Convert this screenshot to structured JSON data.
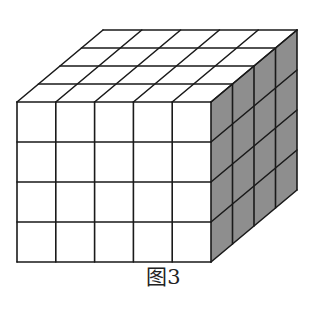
{
  "figure": {
    "caption": "图3",
    "grid": {
      "width_units": 5,
      "height_units": 4,
      "depth_units": 4
    },
    "colors": {
      "line": "#1a1a1a",
      "front_face": "#ffffff",
      "top_face": "#ffffff",
      "side_face": "#8e8e8e"
    },
    "geometry": {
      "front_left": 17,
      "front_right": 211,
      "front_top": 102,
      "front_bottom": 262,
      "depth_dx": 86,
      "depth_dy": -72
    }
  }
}
